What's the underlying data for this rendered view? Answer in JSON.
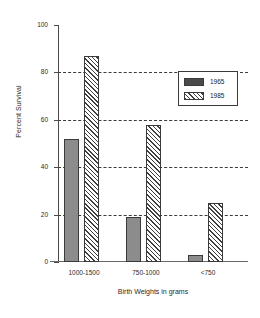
{
  "chart_data": {
    "type": "bar",
    "title": "",
    "subtitle": "",
    "xlabel": "Birth Weights  in grams",
    "ylabel": "Percent Survival",
    "categories": [
      "1000-1500",
      "750-1000",
      "<750"
    ],
    "series": [
      {
        "name": "1965",
        "values": [
          52,
          19,
          3
        ],
        "style": "solid-gray",
        "color": "#8c8c8c"
      },
      {
        "name": "1985",
        "values": [
          87,
          58,
          25
        ],
        "style": "diagonal-hatch",
        "color": "#ffffff"
      }
    ],
    "ylim": [
      0,
      100
    ],
    "yticks": [
      0,
      20,
      40,
      60,
      80,
      100
    ],
    "yticklabels": [
      "0",
      "20",
      "40",
      "60",
      "80",
      "100"
    ],
    "gridlines": [
      20,
      40,
      60,
      80
    ],
    "grid": true,
    "grid_style": "dashed",
    "legend_position": "top-right-inside",
    "annotations": []
  },
  "legend": {
    "entries": [
      {
        "label": "1965",
        "swatch": "solid-swatch"
      },
      {
        "label": "1985",
        "swatch": "hatched-swatch"
      }
    ]
  },
  "colors": {
    "background": "#ffffff",
    "axis": "#4a4a4a",
    "grid": "#3c3c3c",
    "series_1965": "#8c8c8c",
    "series_1985": "#ffffff",
    "outline": "#3a3a3a",
    "text": "#2a2a2a"
  }
}
